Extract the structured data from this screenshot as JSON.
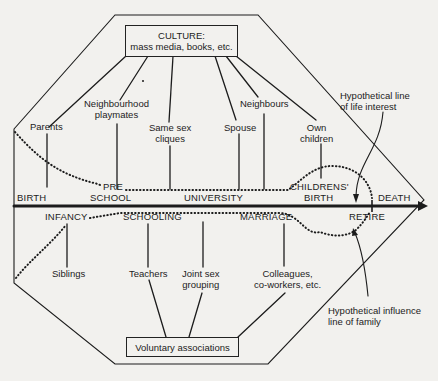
{
  "diagram": {
    "culture_box": {
      "title": "CULTURE:",
      "subtitle": "mass media, books, etc."
    },
    "voluntary_box": {
      "label": "Voluntary associations"
    },
    "upper_influences": [
      {
        "label_line1": "Parents",
        "label_line2": ""
      },
      {
        "label_line1": "Neighbourhood",
        "label_line2": "playmates"
      },
      {
        "label_line1": "Same sex",
        "label_line2": "cliques"
      },
      {
        "label_line1": "Spouse",
        "label_line2": ""
      },
      {
        "label_line1": "Neighbours",
        "label_line2": ""
      },
      {
        "label_line1": "Own",
        "label_line2": "children"
      }
    ],
    "lower_influences": [
      {
        "label_line1": "Siblings",
        "label_line2": ""
      },
      {
        "label_line1": "Teachers",
        "label_line2": ""
      },
      {
        "label_line1": "Joint sex",
        "label_line2": "grouping"
      },
      {
        "label_line1": "Colleagues,",
        "label_line2": "co-workers, etc."
      }
    ],
    "timeline_upper": {
      "birth": "BIRTH",
      "pre": "PRE",
      "school": "SCHOOL",
      "university": "UNIVERSITY",
      "childrens": "CHILDRENS'",
      "childrens_birth": "BIRTH",
      "death": "DEATH"
    },
    "timeline_lower": {
      "infancy": "INFANCY",
      "schooling": "SCHOOLING",
      "marriage": "MARRIAGE",
      "retire": "RETIRE"
    },
    "annotations": {
      "life_interest_line1": "Hypothetical line",
      "life_interest_line2": "of life interest",
      "family_influence_line1": "Hypothetical influence",
      "family_influence_line2": "line of family"
    },
    "colors": {
      "ink": "#1c1c1c",
      "paper": "#f2f1ee"
    }
  }
}
